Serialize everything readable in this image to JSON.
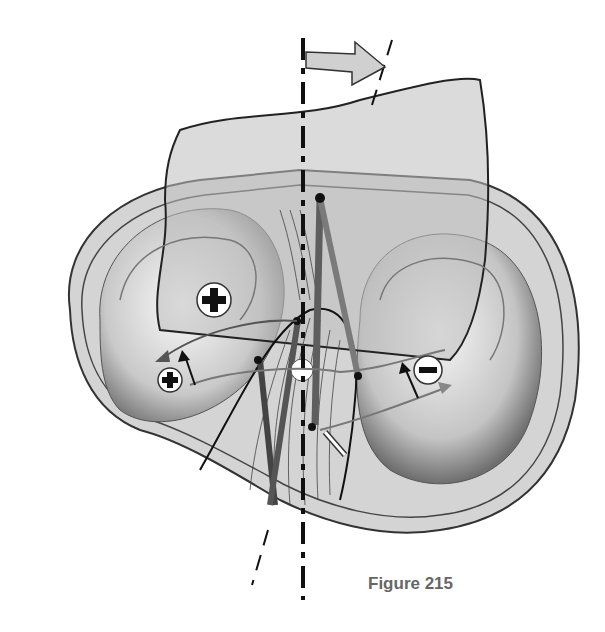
{
  "figure": {
    "caption": "Figure 215",
    "symbols": {
      "plus_large": "+",
      "plus_small": "+",
      "minus": "−"
    },
    "icons": [
      "rotation-arrow-icon",
      "axis-line",
      "plus-sign-icon",
      "minus-sign-icon",
      "center-point-icon"
    ]
  }
}
